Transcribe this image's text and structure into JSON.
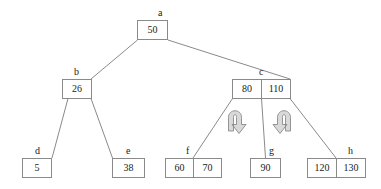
{
  "diagram": {
    "stroke_color": "#8a8a8a",
    "text_color": "#222222",
    "arrow_fill": "#d9d9d9",
    "background": "#ffffff",
    "nodes": [
      {
        "id": "a",
        "label": "a",
        "values": [
          "50"
        ]
      },
      {
        "id": "b",
        "label": "b",
        "values": [
          "26"
        ]
      },
      {
        "id": "c",
        "label": "c",
        "values": [
          "80",
          "110"
        ]
      },
      {
        "id": "d",
        "label": "d",
        "values": [
          "5"
        ]
      },
      {
        "id": "e",
        "label": "e",
        "values": [
          "38"
        ]
      },
      {
        "id": "f",
        "label": "f",
        "values": [
          "60",
          "70"
        ]
      },
      {
        "id": "g",
        "label": "g",
        "values": [
          "90"
        ]
      },
      {
        "id": "h",
        "label": "h",
        "values": [
          "120",
          "130"
        ]
      }
    ],
    "edges": [
      {
        "from": "a",
        "to": "b"
      },
      {
        "from": "a",
        "to": "c"
      },
      {
        "from": "b",
        "to": "d"
      },
      {
        "from": "b",
        "to": "e"
      },
      {
        "from": "c",
        "to": "f"
      },
      {
        "from": "c",
        "to": "g"
      },
      {
        "from": "c",
        "to": "h"
      }
    ],
    "arrows": [
      {
        "id": "left-rotation-arrow",
        "direction": "clockwise"
      },
      {
        "id": "right-rotation-arrow",
        "direction": "counter-clockwise"
      }
    ]
  }
}
